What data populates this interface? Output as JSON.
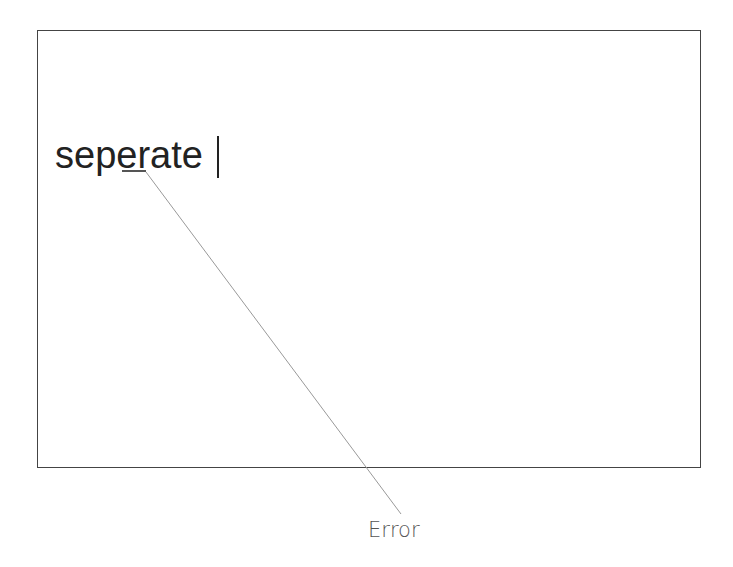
{
  "diagram": {
    "text_field": {
      "word": "seperate",
      "misspelled_segment": "e",
      "caret_visible": true
    },
    "annotation": {
      "label": "Error"
    },
    "colors": {
      "frame": "#444444",
      "text": "#222222",
      "leader_line": "#999999",
      "label": "#555555"
    }
  }
}
